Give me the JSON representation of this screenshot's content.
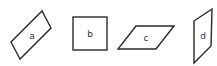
{
  "diagram": {
    "shapes": [
      {
        "id": "a",
        "label": "a",
        "kind": "rotated-rectangle"
      },
      {
        "id": "b",
        "label": "b",
        "kind": "square"
      },
      {
        "id": "c",
        "label": "c",
        "kind": "parallelogram"
      },
      {
        "id": "d",
        "label": "d",
        "kind": "vertical-parallelogram"
      }
    ],
    "colors": {
      "stroke": "#2a2a2a",
      "fill": "#ffffff",
      "label": "#333333"
    }
  }
}
